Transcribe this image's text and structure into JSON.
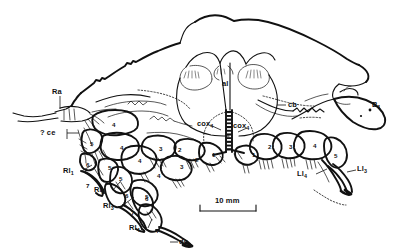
{
  "figure": {
    "caption": "",
    "background_color": "#ffffff",
    "ink_color": "#111111",
    "width": 412,
    "height": 250
  },
  "scale_bar": {
    "label": "10 mm",
    "length_px": 160,
    "tick_style": "end-serifs"
  },
  "labels": {
    "ra": {
      "text": "Ra",
      "sub": ""
    },
    "ce": {
      "text": "? ce",
      "sub": ""
    },
    "al": {
      "text": "al",
      "sub": ""
    },
    "cb": {
      "text": "cb",
      "sub": ""
    },
    "cox4_left": {
      "text": "cox",
      "sub": "4"
    },
    "cox4_right": {
      "text": "cox",
      "sub": "4"
    },
    "b1": {
      "text": "B",
      "sub": "1"
    },
    "rl1": {
      "text": "Rl",
      "sub": "1"
    },
    "rl2": {
      "text": "Rl",
      "sub": "2"
    },
    "rl3": {
      "text": "Rl",
      "sub": "3"
    },
    "rl4": {
      "text": "Rl",
      "sub": "4"
    },
    "ll3": {
      "text": "Ll",
      "sub": "3"
    },
    "ll4": {
      "text": "Ll",
      "sub": "4"
    },
    "dc": {
      "text": "dc",
      "sub": ""
    }
  },
  "segment_numbers": {
    "right_leg_group": [
      "4",
      "5",
      "6",
      "7",
      "4",
      "5",
      "6",
      "7",
      "3",
      "4",
      "5",
      "6",
      "7",
      "2",
      "3",
      "4",
      "5",
      "1"
    ],
    "left_leg_group": [
      "1",
      "2",
      "3",
      "4",
      "5"
    ]
  },
  "segments": [
    {
      "id": "s-r1-4",
      "value": "4",
      "x": 112,
      "y": 122
    },
    {
      "id": "s-r1-5",
      "value": "5",
      "x": 90,
      "y": 141
    },
    {
      "id": "s-r1-6",
      "value": "6",
      "x": 86,
      "y": 162
    },
    {
      "id": "s-r1-7",
      "value": "7",
      "x": 86,
      "y": 183
    },
    {
      "id": "s-r2-4",
      "value": "4",
      "x": 120,
      "y": 145
    },
    {
      "id": "s-r2-5",
      "value": "5",
      "x": 108,
      "y": 165
    },
    {
      "id": "s-r2-6",
      "value": "6",
      "x": 125,
      "y": 193
    },
    {
      "id": "s-r2-7",
      "value": "7",
      "x": 131,
      "y": 210
    },
    {
      "id": "s-r3-3",
      "value": "3",
      "x": 159,
      "y": 146
    },
    {
      "id": "s-r3-4",
      "value": "4",
      "x": 138,
      "y": 158
    },
    {
      "id": "s-r3-5",
      "value": "5",
      "x": 119,
      "y": 176
    },
    {
      "id": "s-r3-6",
      "value": "6",
      "x": 145,
      "y": 196
    },
    {
      "id": "s-r3-7",
      "value": "7",
      "x": 156,
      "y": 228
    },
    {
      "id": "s-r4-2",
      "value": "2",
      "x": 178,
      "y": 147
    },
    {
      "id": "s-r4-3",
      "value": "3",
      "x": 180,
      "y": 164
    },
    {
      "id": "s-r4-4",
      "value": "4",
      "x": 157,
      "y": 173
    },
    {
      "id": "s-r4-5",
      "value": "5",
      "x": 145,
      "y": 194
    },
    {
      "id": "s-r5-2",
      "value": "2",
      "x": 195,
      "y": 157
    },
    {
      "id": "s-r5-1",
      "value": "1",
      "x": 212,
      "y": 152
    },
    {
      "id": "s-l1-1",
      "value": "1",
      "x": 252,
      "y": 152
    },
    {
      "id": "s-l1-2",
      "value": "2",
      "x": 268,
      "y": 144
    },
    {
      "id": "s-l1-3",
      "value": "3",
      "x": 289,
      "y": 144
    },
    {
      "id": "s-l1-4",
      "value": "4",
      "x": 313,
      "y": 143
    },
    {
      "id": "s-l1-5",
      "value": "5",
      "x": 334,
      "y": 153
    }
  ]
}
